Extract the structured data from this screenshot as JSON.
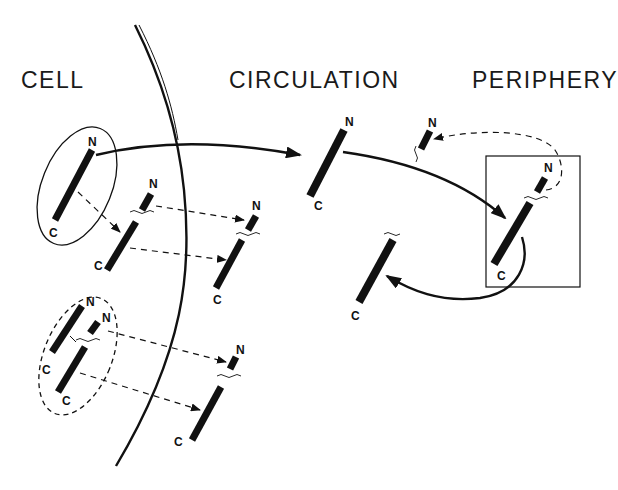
{
  "diagram": {
    "regions": [
      {
        "id": "cell",
        "label": "CELL"
      },
      {
        "id": "circulation",
        "label": "CIRCULATION"
      },
      {
        "id": "periphery",
        "label": "PERIPHERY"
      }
    ],
    "terminus_labels": {
      "n": "N",
      "c": "C"
    },
    "colors": {
      "ink": "#111111",
      "background": "#ffffff"
    },
    "elements": [
      {
        "name": "intact-molecule-cell",
        "region": "cell",
        "enclosure": "solid-ellipse",
        "labels": [
          "N",
          "C"
        ]
      },
      {
        "name": "cleaved-molecule-cell",
        "region": "cell",
        "labels": [
          "N",
          "C"
        ],
        "cleavage_mark": true
      },
      {
        "name": "cleaved-molecule-circulation",
        "region": "circulation",
        "labels": [
          "N",
          "C"
        ],
        "cleavage_mark": true
      },
      {
        "name": "cleaved-pair-cell",
        "region": "cell",
        "enclosure": "dashed-ellipse",
        "labels": [
          "N",
          "N",
          "C",
          "C"
        ]
      },
      {
        "name": "cleaved-fragments-circulation-lower",
        "region": "circulation",
        "labels": [
          "N",
          "C"
        ],
        "cleavage_mark": true
      },
      {
        "name": "intact-molecule-circulation",
        "region": "circulation",
        "labels": [
          "N",
          "C"
        ]
      },
      {
        "name": "n-fragment-periphery",
        "region": "periphery",
        "labels": [
          "N"
        ],
        "cleavage_mark": true
      },
      {
        "name": "molecule-in-target-box",
        "region": "periphery",
        "enclosure": "rectangle",
        "labels": [
          "N",
          "C"
        ],
        "cleavage_mark": true
      },
      {
        "name": "c-fragment-returned",
        "region": "circulation",
        "labels": [
          "C"
        ],
        "cleavage_mark": true
      }
    ],
    "arrows": [
      {
        "from": "intact-molecule-cell",
        "to": "intact-molecule-circulation",
        "style": "solid"
      },
      {
        "from": "intact-molecule-circulation",
        "to": "molecule-in-target-box",
        "style": "solid"
      },
      {
        "from": "molecule-in-target-box",
        "to": "c-fragment-returned",
        "style": "solid"
      },
      {
        "from": "molecule-in-target-box",
        "to": "n-fragment-periphery",
        "style": "dashed"
      },
      {
        "from": "intact-molecule-cell",
        "to": "cleaved-molecule-cell",
        "style": "dashed"
      },
      {
        "from": "cleaved-molecule-cell",
        "to": "cleaved-molecule-circulation",
        "style": "dashed",
        "count": 2
      },
      {
        "from": "cleaved-pair-cell",
        "to": "cleaved-fragments-circulation-lower",
        "style": "dashed",
        "count": 2
      }
    ]
  }
}
